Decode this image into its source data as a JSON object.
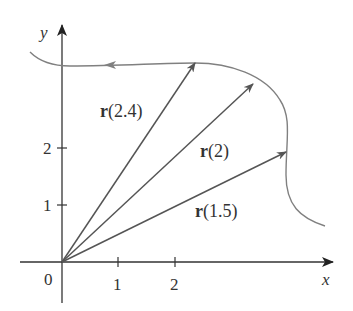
{
  "figure": {
    "axes": {
      "x_label": "x",
      "y_label": "y",
      "origin_label": "0",
      "x_ticks": [
        "1",
        "2"
      ],
      "y_ticks": [
        "1",
        "2"
      ]
    },
    "vectors": [
      {
        "name": "r",
        "arg": "(2.4)",
        "tip": [
          2.32,
          3.48
        ]
      },
      {
        "name": "r",
        "arg": "(2)",
        "tip": [
          3.35,
          3.12
        ]
      },
      {
        "name": "r",
        "arg": "(1.5)",
        "tip": [
          3.93,
          1.93
        ]
      }
    ],
    "colors": {
      "curve": "#808080",
      "vector": "#555555",
      "axis": "#333333",
      "text": "#333333"
    }
  }
}
